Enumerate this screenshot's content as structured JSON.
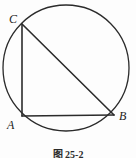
{
  "figure": {
    "caption": "图 25-2",
    "background_color": "#fdfdfd",
    "stroke_color": "#2b2b2b",
    "label_color": "#222222"
  },
  "circle": {
    "name": "circumscribed-circle",
    "center_x": 66,
    "center_y": 68,
    "radius": 63,
    "stroke_width": 1.3
  },
  "vertices": [
    {
      "id": "C",
      "label": "C",
      "x": 22,
      "y": 24
    },
    {
      "id": "A",
      "label": "A",
      "x": 22,
      "y": 116
    },
    {
      "id": "B",
      "label": "B",
      "x": 114,
      "y": 115
    }
  ],
  "segments": [
    {
      "id": "CA",
      "name": "side-ca-vertical",
      "x1": 22,
      "y1": 24,
      "x2": 22,
      "y2": 116,
      "stroke_width": 1.6
    },
    {
      "id": "AB",
      "name": "side-ab-horizontal",
      "x1": 22,
      "y1": 116,
      "x2": 114,
      "y2": 115,
      "stroke_width": 1.6
    },
    {
      "id": "CB",
      "name": "hypotenuse-cb-diameter",
      "x1": 22,
      "y1": 24,
      "x2": 114,
      "y2": 115,
      "stroke_width": 1.6
    }
  ]
}
